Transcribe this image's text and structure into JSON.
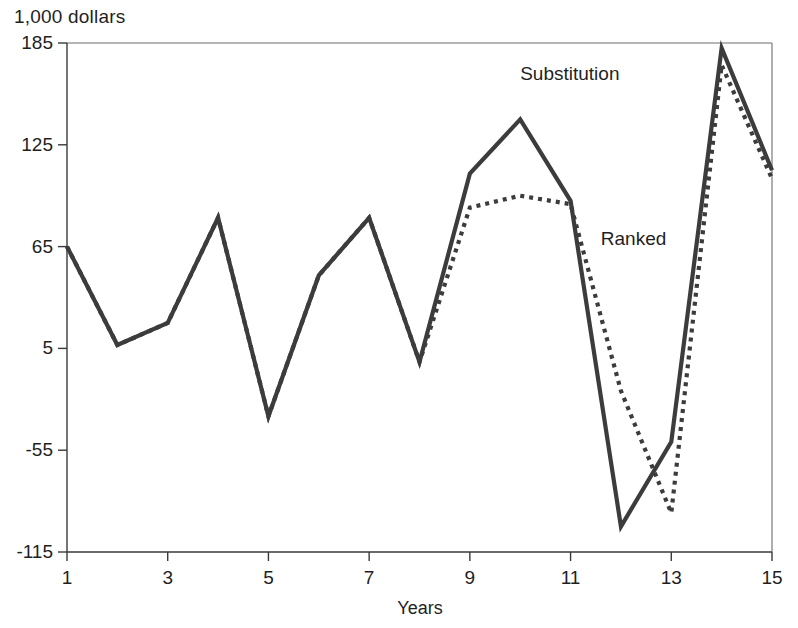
{
  "chart_data": {
    "type": "line",
    "title": "1,000 dollars",
    "subtitle": "",
    "xlabel": "Years",
    "ylabel": "1,000 dollars",
    "x": [
      1,
      2,
      3,
      4,
      5,
      6,
      7,
      8,
      9,
      10,
      11,
      12,
      13,
      14,
      15
    ],
    "xlim": [
      1,
      15
    ],
    "ylim": [
      -115,
      185
    ],
    "x_ticks": [
      1,
      3,
      5,
      7,
      9,
      11,
      13,
      15
    ],
    "x_tick_labels": [
      "1",
      "3",
      "5",
      "7",
      "9",
      "11",
      "13",
      "15"
    ],
    "y_ticks": [
      -115,
      -55,
      5,
      65,
      125,
      185
    ],
    "y_tick_labels": [
      "-115",
      "-55",
      "5",
      "65",
      "125",
      "185"
    ],
    "grid": false,
    "legend_position": "inline-annotation",
    "series": [
      {
        "name": "Substitution",
        "style": "solid",
        "color": "#3c3c3c",
        "label_x": 10,
        "label_y": 163,
        "values": [
          65,
          7,
          20,
          82,
          -35,
          48,
          82,
          -3,
          108,
          140,
          92,
          -100,
          -50,
          182,
          110
        ]
      },
      {
        "name": "Ranked",
        "style": "dotted",
        "color": "#3c3c3c",
        "label_x": 11.6,
        "label_y": 66,
        "values": [
          65,
          7,
          20,
          82,
          -35,
          48,
          82,
          -3,
          88,
          95,
          90,
          -20,
          -92,
          172,
          105
        ]
      }
    ]
  },
  "axis": {
    "x_title": "Years",
    "y_header": "1,000 dollars"
  }
}
